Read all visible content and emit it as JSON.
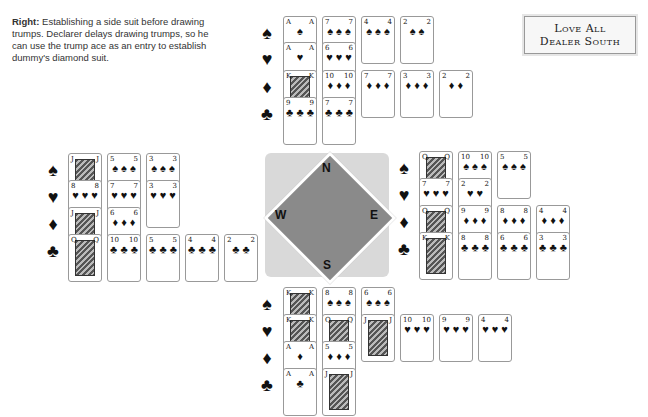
{
  "caption": {
    "lead": "Right:",
    "text": " Establishing a side suit before drawing trumps. Declarer delays drawing trumps, so he can use the trump ace as an entry to establish dummy's diamond suit."
  },
  "infobox": {
    "line1": "Love All",
    "line2": "Dealer South"
  },
  "compass": {
    "north": "N",
    "south": "S",
    "east": "E",
    "west": "W"
  },
  "suit_symbols": {
    "spades": "♠",
    "hearts": "♥",
    "diamonds": "♦",
    "clubs": "♣"
  },
  "hands": {
    "north": {
      "spades": [
        "A",
        "7",
        "4",
        "2"
      ],
      "hearts": [
        "A",
        "6"
      ],
      "diamonds": [
        "K",
        "10",
        "7",
        "3",
        "2"
      ],
      "clubs": [
        "9",
        "7"
      ]
    },
    "west": {
      "spades": [
        "J",
        "5",
        "3"
      ],
      "hearts": [
        "8",
        "7",
        "3"
      ],
      "diamonds": [
        "J",
        "6"
      ],
      "clubs": [
        "Q",
        "10",
        "5",
        "4",
        "2"
      ]
    },
    "east": {
      "spades": [
        "Q",
        "10",
        "5"
      ],
      "hearts": [
        "7",
        "2"
      ],
      "diamonds": [
        "Q",
        "9",
        "8",
        "4"
      ],
      "clubs": [
        "K",
        "8",
        "6",
        "3"
      ]
    },
    "south": {
      "spades": [
        "K",
        "8",
        "6"
      ],
      "hearts": [
        "K",
        "Q",
        "J",
        "10",
        "9",
        "4"
      ],
      "diamonds": [
        "A",
        "5"
      ],
      "clubs": [
        "A",
        "J"
      ]
    }
  }
}
